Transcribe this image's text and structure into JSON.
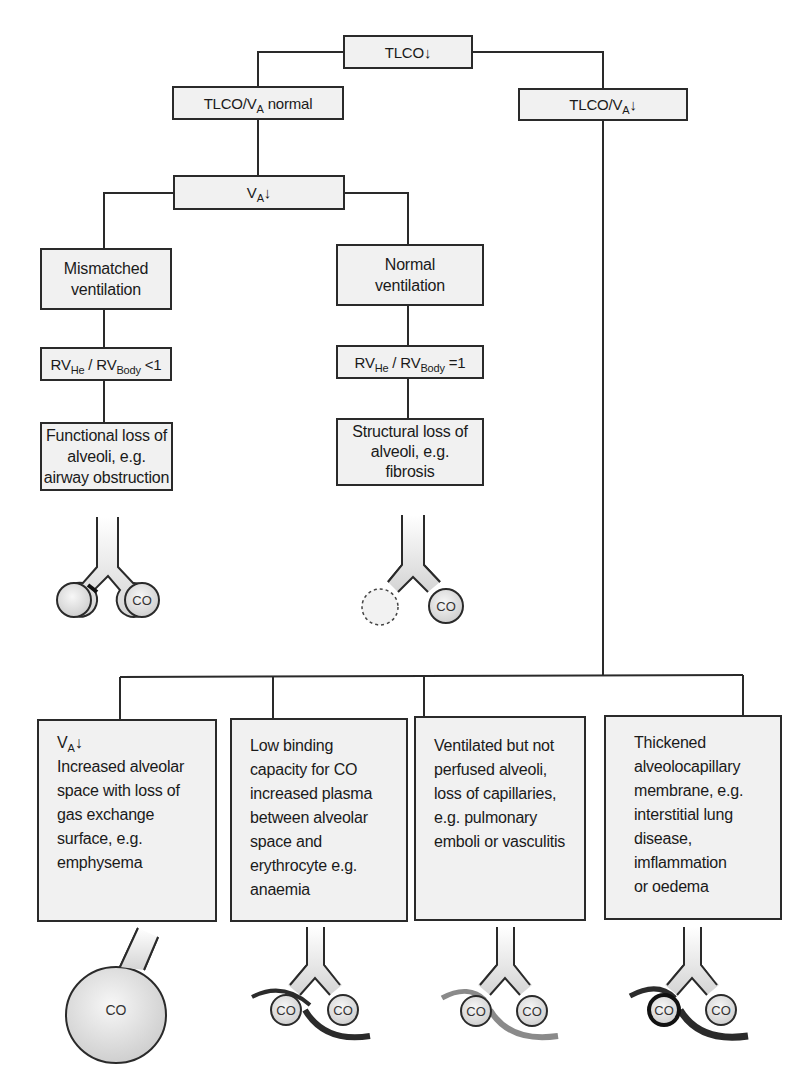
{
  "diagram": {
    "root": {
      "text": "TLCO",
      "arrow": "↓"
    },
    "branch_normal": {
      "text": "TLCO/V",
      "sub": "A",
      "suffix": " normal"
    },
    "branch_low": {
      "text": "TLCO/V",
      "sub": "A",
      "arrow": "↓"
    },
    "va_low": {
      "text": "V",
      "sub": "A",
      "arrow": "↓"
    },
    "mismatched": {
      "title_lines": [
        "Mismatched",
        "ventilation"
      ],
      "ratio": {
        "a": "RV",
        "a_sub": "He",
        "sep": " / RV",
        "b_sub": "Body",
        "op": " <1"
      },
      "result_lines": [
        "Functional loss of",
        "alveoli, e.g.",
        "airway obstruction"
      ],
      "illustration": {
        "alveolus_label": "CO",
        "blocked": true
      }
    },
    "normal_vent": {
      "title_lines": [
        "Normal",
        "ventilation"
      ],
      "ratio": {
        "a": "RV",
        "a_sub": "He",
        "sep": " / RV",
        "b_sub": "Body",
        "op": " =1"
      },
      "result_lines": [
        "Structural loss of",
        "alveoli, e.g.",
        "fibrosis"
      ],
      "illustration": {
        "alveolus_label": "CO",
        "lost_alveolus": "dashed"
      }
    },
    "causes": [
      {
        "heading": {
          "text": "V",
          "sub": "A",
          "arrow": "↓"
        },
        "lines": [
          "Increased alveolar",
          "space with loss of",
          "gas exchange",
          "surface, e.g.",
          "emphysema"
        ],
        "illustration": {
          "labels": [
            "CO"
          ],
          "type": "enlarged-alveolus"
        }
      },
      {
        "lines": [
          "Low binding",
          "capacity for CO",
          "increased plasma",
          "between alveolar",
          "space and",
          "erythrocyte e.g.",
          "anaemia"
        ],
        "illustration": {
          "labels": [
            "CO",
            "CO"
          ],
          "type": "capillary-normal"
        }
      },
      {
        "lines": [
          "Ventilated but not",
          "perfused alveoli,",
          "loss of capillaries,",
          "e.g. pulmonary",
          "emboli or vasculitis"
        ],
        "illustration": {
          "labels": [
            "CO",
            "CO"
          ],
          "type": "capillary-faded"
        }
      },
      {
        "lines": [
          "Thickened",
          "alveolocapillary",
          "membrane, e.g.",
          "interstitial lung",
          "disease,",
          "imflammation",
          "or oedema"
        ],
        "illustration": {
          "labels": [
            "CO",
            "CO"
          ],
          "type": "thickened-membrane"
        }
      }
    ]
  },
  "colors": {
    "box_fill": "#f1f1f1",
    "stroke": "#2a2a2a",
    "alveolus_fill": "#dcdcdc",
    "vessel_dark": "#2b2b2b",
    "vessel_faded": "#8a8a8a"
  }
}
